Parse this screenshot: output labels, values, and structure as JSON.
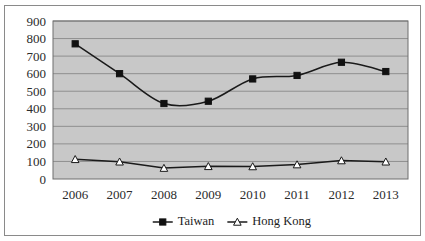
{
  "chart_data": {
    "type": "line",
    "title": "",
    "subtitle": "",
    "xlabel": "",
    "ylabel": "",
    "categories": [
      "2006",
      "2007",
      "2008",
      "2009",
      "2010",
      "2011",
      "2012",
      "2013"
    ],
    "ylim": [
      0,
      900
    ],
    "ytick_step": 100,
    "yticks": [
      "900",
      "800",
      "700",
      "600",
      "500",
      "400",
      "300",
      "200",
      "100",
      "0"
    ],
    "grid": "horizontal",
    "legend_position": "bottom-center",
    "plot_background": "#c8c8c8",
    "gridline_color": "#8f8f8f",
    "series": [
      {
        "name": "Taiwan",
        "marker": "filled-square",
        "marker_color": "#111111",
        "line_color": "#1a1a1a",
        "line_style": "smooth",
        "values": [
          770,
          600,
          430,
          443,
          570,
          590,
          665,
          612
        ]
      },
      {
        "name": "Hong Kong",
        "marker": "hollow-triangle",
        "marker_color": "#ffffff",
        "line_color": "#1a1a1a",
        "line_style": "straight",
        "values": [
          112,
          98,
          62,
          72,
          71,
          82,
          105,
          98
        ]
      }
    ]
  },
  "legend": {
    "items": [
      {
        "label": "Taiwan"
      },
      {
        "label": "Hong Kong"
      }
    ]
  }
}
